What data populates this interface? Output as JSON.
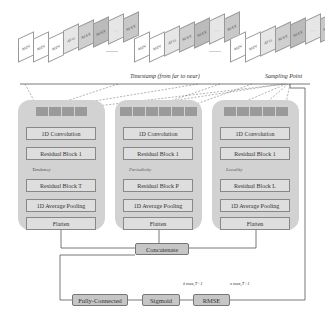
{
  "input_stacks": {
    "stack_labels": [
      "MIN",
      "MIN",
      "MIN",
      "AVG",
      "MAX",
      "MAX",
      "…",
      "MAX"
    ],
    "ellipsis": "……"
  },
  "timeline": {
    "label": "Timestamp (from far to near)",
    "sampling_label": "Sampling Point"
  },
  "branches": [
    {
      "name": "tendency",
      "feature_label": "Tendency",
      "blocks": [
        "1D Convolution",
        "Residual Block 1",
        "Residual Block T",
        "1D Average Pooling",
        "Flatten"
      ]
    },
    {
      "name": "periodicity",
      "feature_label": "Periodicity",
      "blocks": [
        "1D Convolution",
        "Residual Block 1",
        "Residual Block P",
        "1D Average Pooling",
        "Flatten"
      ]
    },
    {
      "name": "locality",
      "feature_label": "Locality",
      "blocks": [
        "1D Convolution",
        "Residual Block 1",
        "Residual Block L",
        "1D Average Pooling",
        "Flatten"
      ]
    }
  ],
  "bottom": {
    "concatenate": "Concatenate",
    "fully_connected": "Fully-Connected",
    "sigmoid": "Sigmoid",
    "rmse": "RMSE",
    "pred_label": "x̂ max,T+1",
    "true_label": "x max,T+1"
  },
  "colors": {
    "panel": "#d2d2d2",
    "block": "#dedede",
    "feature": "#9a9a9a",
    "bottom_box": "#c6c6c6"
  }
}
